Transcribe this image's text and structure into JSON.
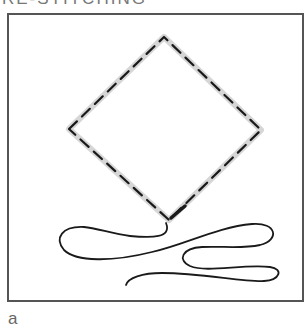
{
  "heading": {
    "text": "RE-STITCHING",
    "clipped": true
  },
  "figure": {
    "colors": {
      "stitch": "#1a1a1a",
      "guide": "#d6d6d6",
      "frame": "#555555",
      "thread": "#1a1a1a"
    }
  },
  "caption": {
    "label": "a"
  }
}
